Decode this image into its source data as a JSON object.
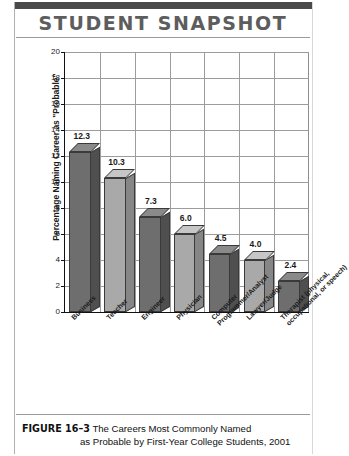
{
  "header": {
    "title": "STUDENT SNAPSHOT"
  },
  "caption": {
    "figure_number": "FIGURE 16–3",
    "line1": "The Careers Most Commonly Named",
    "line2": "as Probable by First-Year College Students, 2001"
  },
  "colors": {
    "band": "#4a4a4a",
    "title": "#5d5d5d",
    "bar_dark": "#6e6e6e",
    "bar_light": "#a9a9a9",
    "grid": "#9c9c9c",
    "axis": "#111111"
  },
  "chart_data": {
    "type": "bar",
    "title": "STUDENT SNAPSHOT",
    "xlabel": "",
    "ylabel": "Percentage Naming Career as \"Probable\"",
    "ylim": [
      0,
      20
    ],
    "ytick_step": 2,
    "yticks": [
      0,
      2,
      4,
      6,
      8,
      10,
      12,
      14,
      16,
      18,
      20
    ],
    "ytick_labels": [
      "0",
      "2",
      "4",
      "6",
      "8",
      "10",
      "12",
      "14",
      "16",
      "18",
      "20"
    ],
    "grid": "both",
    "legend": "none",
    "categories": [
      "Business",
      "Teacher",
      "Engineer",
      "Physician",
      "Computer Programmer/Analyst",
      "Lawyer/Judge",
      "Therapist (physical, occupational, or speech)"
    ],
    "category_lines": [
      [
        "Business"
      ],
      [
        "Teacher"
      ],
      [
        "Engineer"
      ],
      [
        "Physician"
      ],
      [
        "Computer",
        "Programmer/Analyst"
      ],
      [
        "Lawyer/Judge"
      ],
      [
        "Therapist (physical,",
        "occupational, or speech)"
      ]
    ],
    "values": [
      12.3,
      10.3,
      7.3,
      6.0,
      4.5,
      4.0,
      2.4
    ],
    "value_labels": [
      "12.3",
      "10.3",
      "7.3",
      "6.0",
      "4.5",
      "4.0",
      "2.4"
    ],
    "bar_shades": [
      "dark",
      "light",
      "dark",
      "light",
      "dark",
      "light",
      "dark"
    ]
  }
}
